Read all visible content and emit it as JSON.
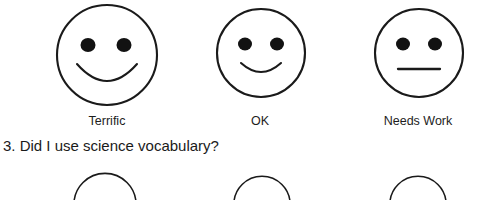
{
  "document": {
    "type": "worksheet-rubric",
    "background_color": "#ffffff",
    "ink_color": "#1a1a1a"
  },
  "rating_scale": {
    "name": "smiley-face-rating-scale",
    "options": [
      {
        "id": "terrific",
        "label": "Terrific",
        "face": "smiling-face",
        "mouth": "wide-smile",
        "center_x": 107,
        "center_y": 61,
        "radius": 51,
        "label_center_x": 107
      },
      {
        "id": "ok",
        "label": "OK",
        "face": "slight-smiling-face",
        "mouth": "shallow-smile",
        "center_x": 260,
        "center_y": 61,
        "radius": 45,
        "label_center_x": 260
      },
      {
        "id": "needs-work",
        "label": "Needs Work",
        "face": "neutral-face",
        "mouth": "straight-line",
        "center_x": 417,
        "center_y": 61,
        "radius": 45,
        "label_center_x": 417
      }
    ]
  },
  "question": {
    "number": "3.",
    "text": "3. Did I use science vocabulary?"
  },
  "next_question_scale": {
    "name": "partial-smiley-face-row",
    "note": "tops of three circles cut off by page edge",
    "faces": [
      {
        "center_x": 105,
        "radius": 44
      },
      {
        "center_x": 262,
        "radius": 40
      },
      {
        "center_x": 418,
        "radius": 40
      }
    ]
  }
}
